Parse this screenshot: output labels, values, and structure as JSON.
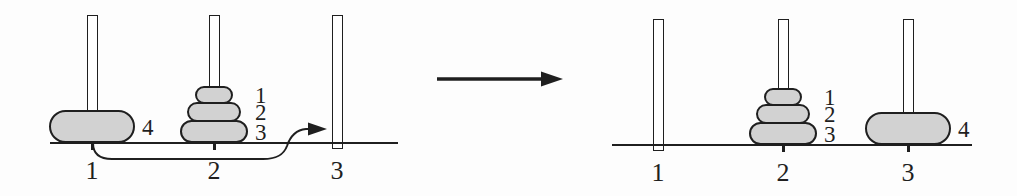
{
  "colors": {
    "background": "#fdfdfd",
    "line": "#1f1f1f",
    "disk_fill": "#d2d2d2",
    "peg_fill": "#ffffff"
  },
  "panels": [
    {
      "name": "before",
      "pegs": [
        {
          "label": "1",
          "disks": [
            {
              "size": 4,
              "label": "4"
            }
          ]
        },
        {
          "label": "2",
          "disks": [
            {
              "size": 3,
              "label": "3"
            },
            {
              "size": 2,
              "label": "2"
            },
            {
              "size": 1,
              "label": "1"
            }
          ]
        },
        {
          "label": "3",
          "disks": []
        }
      ],
      "move_arrow": {
        "icon": "curved-arrow-right",
        "from_peg": "1",
        "to_peg": "3"
      }
    },
    {
      "name": "after",
      "pegs": [
        {
          "label": "1",
          "disks": []
        },
        {
          "label": "2",
          "disks": [
            {
              "size": 3,
              "label": "3"
            },
            {
              "size": 2,
              "label": "2"
            },
            {
              "size": 1,
              "label": "1"
            }
          ]
        },
        {
          "label": "3",
          "disks": [
            {
              "size": 4,
              "label": "4"
            }
          ]
        }
      ]
    }
  ],
  "transition": {
    "icon": "arrow-right"
  }
}
